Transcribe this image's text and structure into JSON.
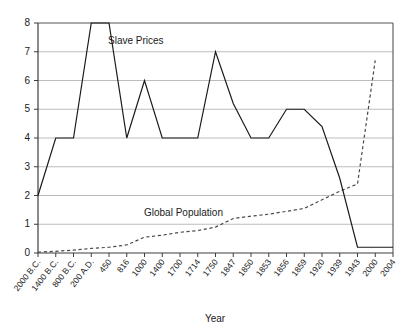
{
  "chart_data": {
    "type": "line",
    "title": "",
    "xlabel": "Year",
    "ylabel": "",
    "ylim": [
      0,
      8
    ],
    "yticks": [
      0,
      1,
      2,
      3,
      4,
      5,
      6,
      7,
      8
    ],
    "grid": true,
    "legend_position": "inline-annotation",
    "categories": [
      "2000 B.C.",
      "1400 B.C.",
      "800 B.C.",
      "200 A.D.",
      "450",
      "816",
      "1000",
      "1400",
      "1700",
      "1714",
      "1750",
      "1847",
      "1850",
      "1853",
      "1856",
      "1859",
      "1920",
      "1939",
      "1943",
      "2000",
      "2004"
    ],
    "series": [
      {
        "name": "Slave Prices",
        "style": "solid",
        "color": "#1a1a1a",
        "values": [
          2,
          4,
          4,
          8,
          8,
          4,
          6,
          4,
          4,
          4,
          7,
          5.2,
          4,
          4,
          5,
          5,
          4.4,
          2.6,
          0.2,
          0.2,
          0.2
        ]
      },
      {
        "name": "Global Population",
        "style": "dashed",
        "color": "#4a4a4a",
        "values": [
          0.03,
          0.06,
          0.1,
          0.16,
          0.2,
          0.28,
          0.55,
          0.62,
          0.72,
          0.78,
          0.9,
          1.2,
          1.28,
          1.35,
          1.45,
          1.55,
          1.85,
          2.15,
          2.4,
          6.7,
          null
        ]
      }
    ],
    "annotations": [
      {
        "text": "Slave Prices",
        "x_px": 108,
        "y_px": 44
      },
      {
        "text": "Global Population",
        "x_px": 144,
        "y_px": 216
      }
    ]
  },
  "axis": {
    "x_title": "Year"
  }
}
